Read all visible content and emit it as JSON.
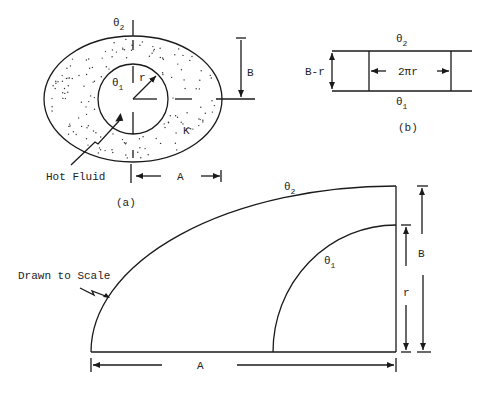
{
  "figure_a": {
    "theta2_label": "θ",
    "theta2_sub": "2",
    "theta1_label": "θ",
    "theta1_sub": "1",
    "r_label": "r",
    "B_label": "B",
    "K_label": "K",
    "A_label": "A",
    "hot_fluid_label": "Hot Fluid",
    "caption": "(a)"
  },
  "figure_b": {
    "theta2_label": "θ",
    "theta2_sub": "2",
    "theta1_label": "θ",
    "theta1_sub": "1",
    "height_label": "B-r",
    "width_label": "2πr",
    "caption": "(b)"
  },
  "figure_c": {
    "theta2_label": "θ",
    "theta2_sub": "2",
    "theta1_label": "θ",
    "theta1_sub": "1",
    "note_label": "Drawn to Scale",
    "A_label": "A",
    "B_label": "B",
    "r_label": "r"
  }
}
